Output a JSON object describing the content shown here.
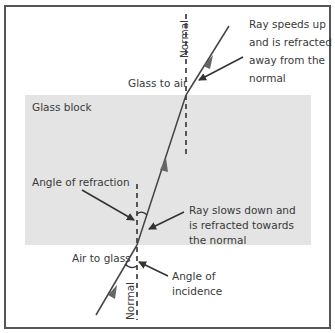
{
  "diagram": {
    "block_label": "Glass block",
    "labels": {
      "normal_top": "Normal",
      "normal_bottom": "Normal",
      "glass_to_air": "Glass to air",
      "air_to_glass": "Air to glass",
      "angle_of_refraction": "Angle of refraction",
      "angle_of_incidence": [
        "Angle of",
        "incidence"
      ],
      "speeds_up": [
        "Ray speeds up",
        "and is refracted",
        "away from the",
        "normal"
      ],
      "slows_down": [
        "Ray slows down and",
        "is refracted towards",
        "the normal"
      ]
    },
    "colors": {
      "glass_fill": "#e4e4e4",
      "line": "#444444",
      "frame": "#555555"
    }
  }
}
